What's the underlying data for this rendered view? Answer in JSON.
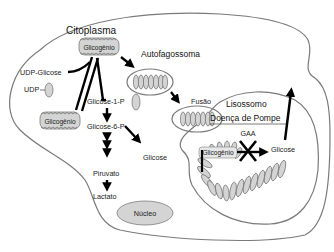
{
  "diagram": {
    "compartments": {
      "cytoplasm": "Citoplasma",
      "autophagosome": "Autofagossoma",
      "lysosome": "Lisossomo",
      "nucleus": "Núcleo"
    },
    "labels": {
      "glycogen_top": "Glicogênio",
      "glycogen_left": "Glicogênio",
      "glycogen_lysosome": "Glicogênio",
      "udp_glucose": "UDP-Glicose",
      "udp": "UDP",
      "glucose_1p": "Glicose-1-P",
      "glucose_6p": "Glicose-6-P",
      "glucose_cyto": "Glicose",
      "pyruvate": "Piruvato",
      "lactate": "Lactato",
      "fusion": "Fusão",
      "disease": "Doença de Pompe",
      "enzyme": "GAA",
      "glucose_lysosome": "Glicose"
    },
    "colors": {
      "membrane": "#7a7a7a",
      "organelle_fill": "#d4d4d4",
      "arrow": "#000000"
    }
  }
}
